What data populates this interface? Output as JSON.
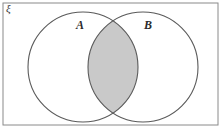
{
  "figure": {
    "type": "venn-diagram",
    "title": "",
    "universal_set_symbol": "ξ",
    "labels": {
      "set_a": "A",
      "set_b": "B"
    },
    "sets": [
      {
        "name": "A",
        "label": "A",
        "cx": 83,
        "cy": 67,
        "r": 55,
        "fill": "#ffffff",
        "stroke": "#5a5a5a"
      },
      {
        "name": "B",
        "label": "B",
        "cx": 143,
        "cy": 67,
        "r": 55,
        "fill": "#ffffff",
        "stroke": "#5a5a5a"
      }
    ],
    "shaded_region": {
      "name": "intersection",
      "description": "A intersect B",
      "fill": "#c9c9c9",
      "stroke": "#6b6b6b"
    },
    "frame": {
      "x": 3,
      "y": 3,
      "width": 215,
      "height": 122,
      "stroke": "#8a8a8a",
      "fill": "#ffffff"
    },
    "colors": {
      "background": "#ffffff",
      "outline": "#5a5a5a",
      "frame_border": "#8a8a8a",
      "shade": "#c9c9c9",
      "text": "#2b2b2b"
    }
  }
}
